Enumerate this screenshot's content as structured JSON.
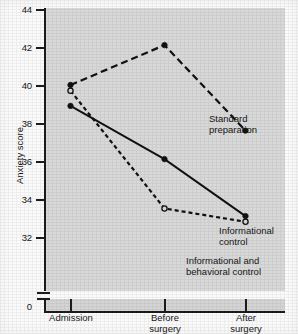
{
  "chart_data": {
    "type": "line",
    "title": "",
    "xlabel": "",
    "ylabel": "Anxiety score",
    "categories": [
      "Admission",
      "Before surgery",
      "After surgery"
    ],
    "category_lines": [
      [
        "Admission"
      ],
      [
        "Before",
        "surgery"
      ],
      [
        "After",
        "surgery"
      ]
    ],
    "yticks": [
      44,
      42,
      40,
      38,
      36,
      34,
      32
    ],
    "ytick_labels": [
      "44",
      "42",
      "40",
      "38",
      "36",
      "34",
      "32"
    ],
    "zero_label": "0",
    "ylim": [
      32,
      44
    ],
    "axis_break": true,
    "grid": false,
    "legend_position": "inline-annotations",
    "series": [
      {
        "name": "Standard preparation",
        "label_lines": [
          "Standard",
          "preparation"
        ],
        "values": [
          40.0,
          42.1,
          37.6
        ],
        "line_style": "long-dash",
        "marker": "filled-circle",
        "color": "#111111"
      },
      {
        "name": "Informational control",
        "label_lines": [
          "Informational",
          "control"
        ],
        "values": [
          38.9,
          36.1,
          33.1
        ],
        "line_style": "solid",
        "marker": "filled-circle",
        "color": "#111111"
      },
      {
        "name": "Informational and behavioral control",
        "label_lines": [
          "Informational and",
          "behavioral control"
        ],
        "values": [
          39.7,
          33.5,
          32.8
        ],
        "line_style": "short-dash",
        "marker": "open-circle",
        "color": "#111111"
      }
    ],
    "colors": {
      "plot_background": "#d9d9d9",
      "page_background": "#fbfbfb",
      "ink": "#1c1c1c",
      "text": "#171717"
    }
  }
}
